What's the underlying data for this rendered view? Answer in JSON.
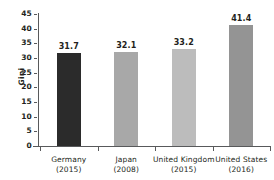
{
  "figure": {
    "clipped_header_text": "",
    "background_color": "#ffffff",
    "text_color": "#231f20",
    "axis_color": "#58595b"
  },
  "chart_data": {
    "type": "bar",
    "title": "",
    "xlabel": "",
    "ylabel": "Gini",
    "ylim": [
      0,
      45
    ],
    "ytick_step": 5,
    "ytick_labels": [
      "0",
      "5",
      "10",
      "15",
      "20",
      "25",
      "30",
      "35",
      "40",
      "45"
    ],
    "ytick_values": [
      0,
      5,
      10,
      15,
      20,
      25,
      30,
      35,
      40,
      45
    ],
    "grid": false,
    "legend": false,
    "categories": [
      "Germany",
      "Japan",
      "United Kingdom",
      "United States"
    ],
    "category_sublabels": [
      "(2015)",
      "(2008)",
      "(2015)",
      "(2016)"
    ],
    "values": [
      31.7,
      32.1,
      33.2,
      41.4
    ],
    "value_labels": [
      "31.7",
      "32.1",
      "33.2",
      "41.4"
    ],
    "bar_colors": [
      "#2b2b2b",
      "#a8a8a8",
      "#bcbcbc",
      "#949494"
    ]
  }
}
